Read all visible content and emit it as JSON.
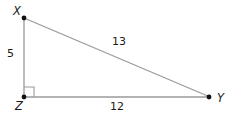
{
  "figure": {
    "type": "right-triangle-diagram",
    "labels": {
      "vertex_x": "X",
      "vertex_z": "Z",
      "vertex_y": "Y",
      "side_xz": "5",
      "side_zy": "12",
      "side_xy": "13"
    },
    "right_angle_at": "Z",
    "colors": {
      "line": "#9a9a9a",
      "text": "#1a1a1a",
      "dot": "#111111",
      "background": "#ffffff"
    }
  }
}
